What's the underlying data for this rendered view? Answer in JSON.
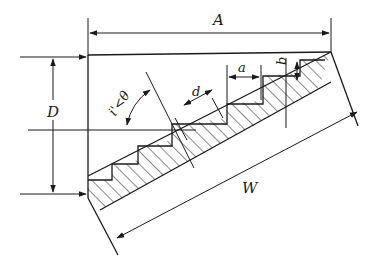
{
  "diagram": {
    "labels": {
      "A": "A",
      "D": "D",
      "W": "W",
      "a": "a",
      "b": "b",
      "d": "d",
      "angle": "i'<θ"
    },
    "colors": {
      "stroke": "#1a1a1a",
      "background": "#ffffff"
    }
  }
}
